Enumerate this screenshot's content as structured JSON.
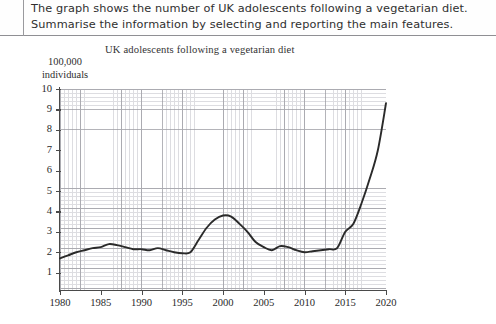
{
  "prompt": {
    "line1": "The graph shows the number of UK adolescents following a vegetarian diet.",
    "line2": "Summarise the information by selecting and reporting the main features."
  },
  "chart_data": {
    "type": "line",
    "title": "UK adolescents following a vegetarian diet",
    "ylabel_line1": "100,000",
    "ylabel_line2": "individuals",
    "xlabel": "",
    "xlim": [
      1980,
      2020
    ],
    "ylim": [
      0.15,
      10
    ],
    "grid": true,
    "legend": "none",
    "ytick_labels": [
      "10",
      "9",
      "8",
      "7",
      "6",
      "5",
      "4",
      "3",
      "2",
      "1"
    ],
    "ytick_values": [
      10,
      9,
      8,
      7,
      6,
      5,
      4,
      3,
      2,
      1
    ],
    "xtick_labels": [
      "1980",
      "1985",
      "1990",
      "1995",
      "2000",
      "2005",
      "2010",
      "2015",
      "2020"
    ],
    "xtick_values": [
      1980,
      1985,
      1990,
      1995,
      2000,
      2005,
      2010,
      2015,
      2020
    ],
    "series": [
      {
        "name": "UK adolescents following a vegetarian diet",
        "units": "100,000 individuals",
        "color": "#2a2a2a",
        "x": [
          1980,
          1981,
          1982,
          1983,
          1984,
          1985,
          1986,
          1987,
          1988,
          1989,
          1990,
          1991,
          1992,
          1993,
          1994,
          1995,
          1996,
          1997,
          1998,
          1999,
          2000,
          2001,
          2002,
          2003,
          2004,
          2005,
          2006,
          2007,
          2008,
          2009,
          2010,
          2011,
          2012,
          2013,
          2014,
          2015,
          2016,
          2017,
          2018,
          2019,
          2020
        ],
        "values": [
          1.7,
          1.85,
          2.0,
          2.1,
          2.2,
          2.25,
          2.4,
          2.35,
          2.25,
          2.15,
          2.15,
          2.1,
          2.2,
          2.1,
          2.0,
          1.95,
          2.0,
          2.6,
          3.2,
          3.6,
          3.8,
          3.75,
          3.4,
          3.0,
          2.5,
          2.25,
          2.1,
          2.3,
          2.25,
          2.1,
          2.0,
          2.05,
          2.1,
          2.15,
          2.2,
          3.0,
          3.4,
          4.4,
          5.6,
          7.0,
          9.3
        ]
      }
    ]
  }
}
